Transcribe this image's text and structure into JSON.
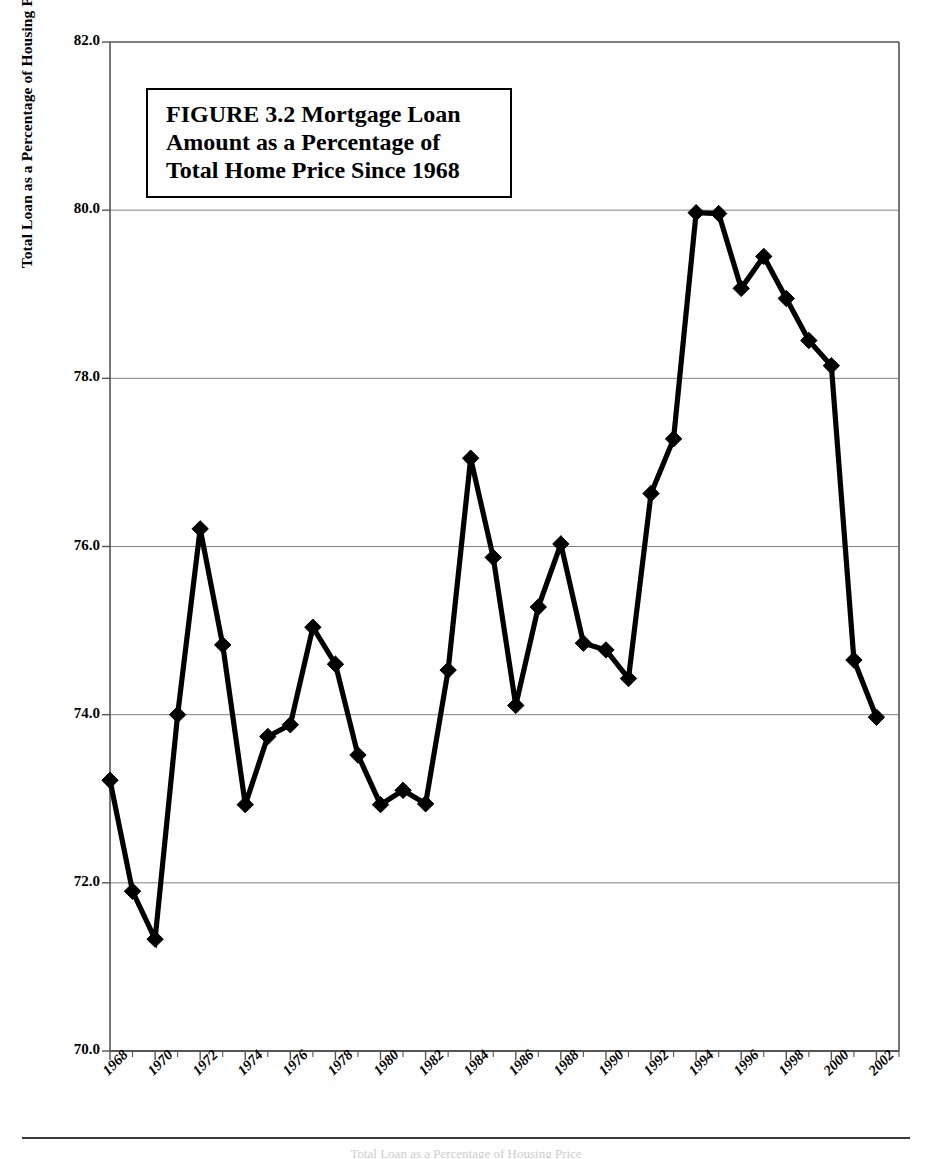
{
  "figure": {
    "title_lines": [
      "FIGURE 3.2  Mortgage Loan",
      "Amount as a Percentage of",
      "Total Home Price Since 1968"
    ],
    "bottom_caption": "Total Loan as a Percentage of Housing Price"
  },
  "axes": {
    "y_title": "Total Loan as a Percentage of Housing Price",
    "y_ticks": [
      "82.0",
      "80.0",
      "78.0",
      "76.0",
      "74.0",
      "72.0",
      "70.0"
    ],
    "x_ticks": [
      "1968",
      "1970",
      "1972",
      "1974",
      "1976",
      "1978",
      "1980",
      "1982",
      "1984",
      "1986",
      "1988",
      "1990",
      "1992",
      "1994",
      "1996",
      "1998",
      "2000",
      "2002"
    ]
  },
  "colors": {
    "line": "#000000",
    "marker": "#000000",
    "grid": "#808080",
    "axis": "#555555",
    "background": "#ffffff"
  },
  "chart_data": {
    "type": "line",
    "title": "FIGURE 3.2  Mortgage Loan Amount as a Percentage of Total Home Price Since 1968",
    "xlabel": "",
    "ylabel": "Total Loan as a Percentage of Housing Price",
    "ylim": [
      70.0,
      82.0
    ],
    "xlim": [
      1968,
      2003
    ],
    "ytick_step": 2.0,
    "xtick_step": 2,
    "grid": true,
    "legend": false,
    "marker": "diamond",
    "x": [
      1968,
      1969,
      1970,
      1971,
      1972,
      1973,
      1974,
      1975,
      1976,
      1977,
      1978,
      1979,
      1980,
      1981,
      1982,
      1983,
      1984,
      1985,
      1986,
      1987,
      1988,
      1989,
      1990,
      1991,
      1992,
      1993,
      1994,
      1995,
      1996,
      1997,
      1998,
      1999,
      2000,
      2001,
      2002
    ],
    "values": [
      73.22,
      71.9,
      71.33,
      74.0,
      76.21,
      74.83,
      72.93,
      73.74,
      73.88,
      75.04,
      74.6,
      73.52,
      72.93,
      73.1,
      72.94,
      74.53,
      77.05,
      75.87,
      74.11,
      75.28,
      76.03,
      74.85,
      74.77,
      74.43,
      76.63,
      77.28,
      79.97,
      79.96,
      79.07,
      79.45,
      78.95,
      78.45,
      78.15,
      74.65,
      73.97
    ],
    "series": [
      {
        "name": "Total Loan as a Percentage of Housing Price",
        "values": [
          73.22,
          71.9,
          71.33,
          74.0,
          76.21,
          74.83,
          72.93,
          73.74,
          73.88,
          75.04,
          74.6,
          73.52,
          72.93,
          73.1,
          72.94,
          74.53,
          77.05,
          75.87,
          74.11,
          75.28,
          76.03,
          74.85,
          74.77,
          74.43,
          76.63,
          77.28,
          79.97,
          79.96,
          79.07,
          79.45,
          78.95,
          78.45,
          78.15,
          74.65,
          73.97
        ]
      }
    ]
  }
}
